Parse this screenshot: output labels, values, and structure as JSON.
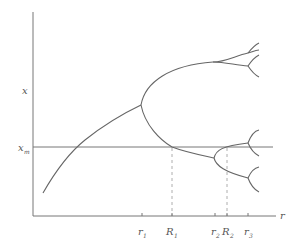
{
  "diagram": {
    "colors": {
      "axis": "#777777",
      "curve": "#666666",
      "dashed": "#999999",
      "label": "#555555"
    },
    "axes": {
      "y_label": "x",
      "x_label": "r",
      "hline_label_base": "x",
      "hline_label_sub": "m"
    },
    "ticks": [
      {
        "base": "r",
        "sub": "1"
      },
      {
        "base": "R",
        "sub": "1"
      },
      {
        "base": "r",
        "sub": "2"
      },
      {
        "base": "R",
        "sub": "2"
      },
      {
        "base": "r",
        "sub": "3"
      }
    ]
  }
}
